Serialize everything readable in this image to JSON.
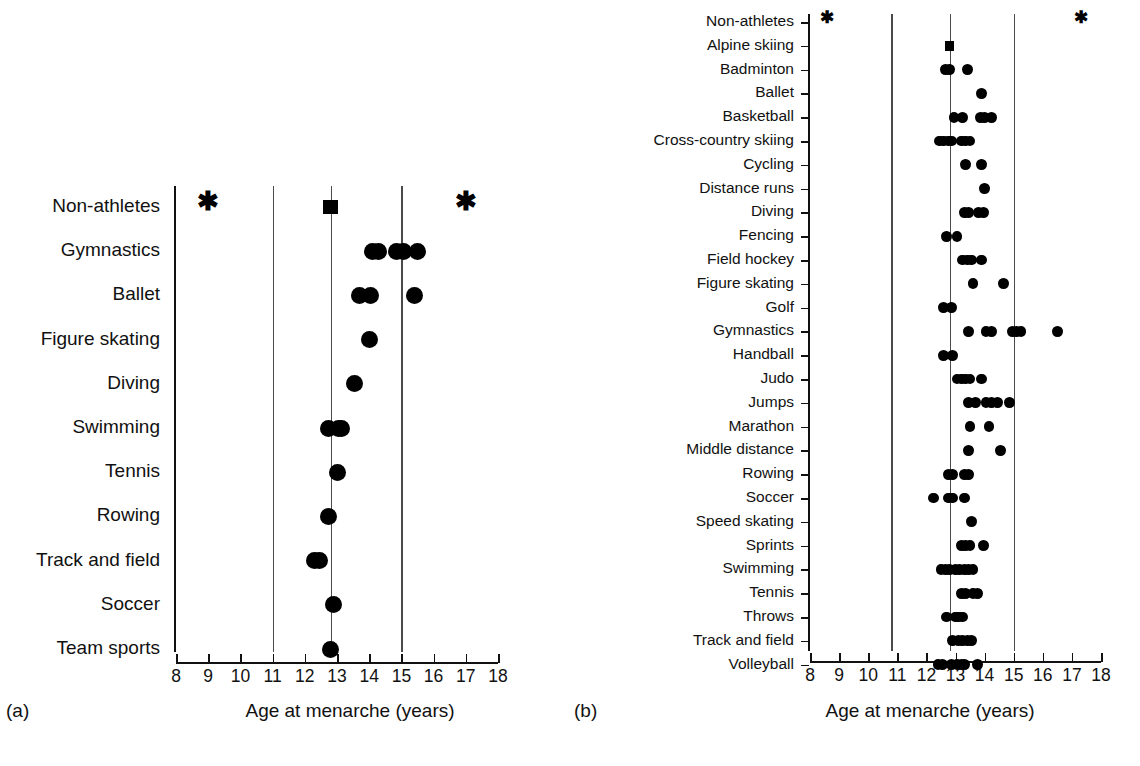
{
  "figure": {
    "axis_title": "Age at menarche (years)",
    "panel_a_tag": "(a)",
    "panel_b_tag": "(b)",
    "caption": ""
  },
  "chart_data": [
    {
      "type": "scatter",
      "panel": "a",
      "title": "",
      "xlabel": "Age at menarche (years)",
      "ylabel": "",
      "xlim": [
        8,
        18
      ],
      "xticks": [
        8,
        9,
        10,
        11,
        12,
        13,
        14,
        15,
        16,
        17,
        18
      ],
      "xtick_labels": [
        "8",
        "9",
        "10",
        "11",
        "12",
        "13",
        "14",
        "15",
        "16",
        "17",
        "18"
      ],
      "grid": false,
      "legend": "none",
      "reference_lines": [
        11.0,
        12.8,
        15.0
      ],
      "categories": [
        "Non-athletes",
        "Gymnastics",
        "Ballet",
        "Figure skating",
        "Diving",
        "Swimming",
        "Tennis",
        "Rowing",
        "Track and field",
        "Soccer",
        "Team sports"
      ],
      "rows": [
        {
          "label": "Non-athletes",
          "squares": [
            12.8
          ],
          "stars": [
            9.0,
            17.0
          ],
          "values": []
        },
        {
          "label": "Gymnastics",
          "squares": [],
          "stars": [],
          "values": [
            14.1,
            14.3,
            14.85,
            15.05,
            15.5
          ]
        },
        {
          "label": "Ballet",
          "squares": [],
          "stars": [],
          "values": [
            13.7,
            14.05,
            15.4
          ]
        },
        {
          "label": "Figure skating",
          "squares": [],
          "stars": [],
          "values": [
            14.0
          ]
        },
        {
          "label": "Diving",
          "squares": [],
          "stars": [],
          "values": [
            13.55
          ]
        },
        {
          "label": "Swimming",
          "squares": [],
          "stars": [],
          "values": [
            12.75,
            13.05,
            13.15
          ]
        },
        {
          "label": "Tennis",
          "squares": [],
          "stars": [],
          "values": [
            13.0
          ]
        },
        {
          "label": "Rowing",
          "squares": [],
          "stars": [],
          "values": [
            12.75
          ]
        },
        {
          "label": "Track and field",
          "squares": [],
          "stars": [],
          "values": [
            12.3,
            12.45
          ]
        },
        {
          "label": "Soccer",
          "squares": [],
          "stars": [],
          "values": [
            12.9
          ]
        },
        {
          "label": "Team sports",
          "squares": [],
          "stars": [],
          "values": [
            12.8
          ]
        }
      ]
    },
    {
      "type": "scatter",
      "panel": "b",
      "title": "",
      "xlabel": "Age at menarche (years)",
      "ylabel": "",
      "xlim": [
        8,
        18
      ],
      "xticks": [
        8,
        9,
        10,
        11,
        12,
        13,
        14,
        15,
        16,
        17,
        18
      ],
      "xtick_labels": [
        "8",
        "9",
        "10",
        "11",
        "12",
        "13",
        "14",
        "15",
        "16",
        "17",
        "18"
      ],
      "grid": false,
      "legend": "none",
      "reference_lines": [
        10.8,
        12.8,
        15.0
      ],
      "categories": [
        "Non-athletes",
        "Alpine skiing",
        "Badminton",
        "Ballet",
        "Basketball",
        "Cross-country skiing",
        "Cycling",
        "Distance runs",
        "Diving",
        "Fencing",
        "Field hockey",
        "Figure skating",
        "Golf",
        "Gymnastics",
        "Handball",
        "Judo",
        "Jumps",
        "Marathon",
        "Middle distance",
        "Rowing",
        "Soccer",
        "Speed skating",
        "Sprints",
        "Swimming",
        "Tennis",
        "Throws",
        "Track and field",
        "Volleyball"
      ],
      "rows": [
        {
          "label": "Non-athletes",
          "squares": [],
          "stars": [
            8.6,
            17.3
          ],
          "values": []
        },
        {
          "label": "Alpine skiing",
          "squares": [
            12.8
          ],
          "stars": [],
          "values": []
        },
        {
          "label": "Badminton",
          "squares": [],
          "stars": [],
          "values": [
            12.65,
            12.8,
            13.4
          ]
        },
        {
          "label": "Ballet",
          "squares": [],
          "stars": [],
          "values": [
            13.9
          ]
        },
        {
          "label": "Basketball",
          "squares": [],
          "stars": [],
          "values": [
            12.95,
            13.25,
            13.85,
            14.0,
            14.25
          ]
        },
        {
          "label": "Cross-country skiing",
          "squares": [],
          "stars": [],
          "values": [
            12.45,
            12.6,
            12.75,
            12.85,
            13.2,
            13.35,
            13.5
          ]
        },
        {
          "label": "Cycling",
          "squares": [],
          "stars": [],
          "values": [
            13.35,
            13.9
          ]
        },
        {
          "label": "Distance runs",
          "squares": [],
          "stars": [],
          "values": [
            14.0
          ]
        },
        {
          "label": "Diving",
          "squares": [],
          "stars": [],
          "values": [
            13.3,
            13.45,
            13.8,
            13.95
          ]
        },
        {
          "label": "Fencing",
          "squares": [],
          "stars": [],
          "values": [
            12.7,
            13.05
          ]
        },
        {
          "label": "Field hockey",
          "squares": [],
          "stars": [],
          "values": [
            13.25,
            13.4,
            13.55,
            13.9
          ]
        },
        {
          "label": "Figure skating",
          "squares": [],
          "stars": [],
          "values": [
            13.6,
            14.65
          ]
        },
        {
          "label": "Golf",
          "squares": [],
          "stars": [],
          "values": [
            12.6,
            12.85
          ]
        },
        {
          "label": "Gymnastics",
          "squares": [],
          "stars": [],
          "values": [
            13.45,
            14.05,
            14.25,
            14.95,
            15.1,
            15.25,
            16.5
          ]
        },
        {
          "label": "Handball",
          "squares": [],
          "stars": [],
          "values": [
            12.6,
            12.9
          ]
        },
        {
          "label": "Judo",
          "squares": [],
          "stars": [],
          "values": [
            13.05,
            13.2,
            13.35,
            13.5,
            13.9
          ]
        },
        {
          "label": "Jumps",
          "squares": [],
          "stars": [],
          "values": [
            13.45,
            13.7,
            14.05,
            14.25,
            14.45,
            14.85
          ]
        },
        {
          "label": "Marathon",
          "squares": [],
          "stars": [],
          "values": [
            13.5,
            14.15
          ]
        },
        {
          "label": "Middle distance",
          "squares": [],
          "stars": [],
          "values": [
            13.45,
            14.55
          ]
        },
        {
          "label": "Rowing",
          "squares": [],
          "stars": [],
          "values": [
            12.75,
            12.9,
            13.3,
            13.45
          ]
        },
        {
          "label": "Soccer",
          "squares": [],
          "stars": [],
          "values": [
            12.25,
            12.75,
            12.9,
            13.3
          ]
        },
        {
          "label": "Speed skating",
          "squares": [],
          "stars": [],
          "values": [
            13.55
          ]
        },
        {
          "label": "Sprints",
          "squares": [],
          "stars": [],
          "values": [
            13.2,
            13.35,
            13.5,
            13.95
          ]
        },
        {
          "label": "Swimming",
          "squares": [],
          "stars": [],
          "values": [
            12.5,
            12.65,
            12.8,
            13.0,
            13.15,
            13.3,
            13.45,
            13.6
          ]
        },
        {
          "label": "Tennis",
          "squares": [],
          "stars": [],
          "values": [
            13.2,
            13.35,
            13.6,
            13.75
          ]
        },
        {
          "label": "Throws",
          "squares": [],
          "stars": [],
          "values": [
            12.7,
            13.0,
            13.1,
            13.25
          ]
        },
        {
          "label": "Track and field",
          "squares": [],
          "stars": [],
          "values": [
            12.9,
            13.1,
            13.25,
            13.4,
            13.55
          ]
        },
        {
          "label": "Volleyball",
          "squares": [],
          "stars": [],
          "values": [
            12.4,
            12.55,
            12.85,
            13.05,
            13.2,
            13.3,
            13.75
          ]
        }
      ]
    }
  ]
}
